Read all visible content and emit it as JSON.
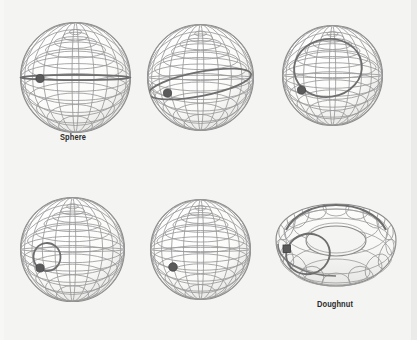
{
  "figure": {
    "background_color": "#f4f4f2",
    "grid_color": "#9a9a9a",
    "outline_color": "#8a8a8a",
    "loop_color": "#6e6e6e",
    "marker_color": "#5a5a5a",
    "caption_color": "#2b2b2b",
    "width": 417,
    "height": 340,
    "columns": 3,
    "rows": 2
  },
  "captions": {
    "sphere": "Sphere",
    "doughnut": "Doughnut"
  },
  "panels": [
    {
      "id": "panel-1",
      "shape": "sphere",
      "position": "top-left",
      "caption": "Sphere",
      "loop": "great-circle-equator",
      "loop_size": "full",
      "marker": "point-on-loop",
      "center_x": 75,
      "center_y": 77,
      "radius": 57
    },
    {
      "id": "panel-2",
      "shape": "sphere",
      "position": "top-center",
      "caption": "",
      "loop": "tilted-circle",
      "loop_size": "large",
      "marker": "point-on-loop",
      "center_x": 200,
      "center_y": 77,
      "radius": 55
    },
    {
      "id": "panel-3",
      "shape": "sphere",
      "position": "top-right",
      "caption": "",
      "loop": "offset-circle-upper",
      "loop_size": "medium",
      "marker": "point-on-loop",
      "center_x": 332,
      "center_y": 75,
      "radius": 52
    },
    {
      "id": "panel-4",
      "shape": "sphere",
      "position": "bottom-left",
      "caption": "",
      "loop": "small-circle",
      "loop_size": "small",
      "marker": "point-on-loop",
      "center_x": 73,
      "center_y": 250,
      "radius": 53
    },
    {
      "id": "panel-5",
      "shape": "sphere",
      "position": "bottom-center",
      "caption": "",
      "loop": "contracted-to-point",
      "loop_size": "none",
      "marker": "single-point",
      "center_x": 201,
      "center_y": 250,
      "radius": 51
    },
    {
      "id": "panel-6",
      "shape": "torus",
      "position": "bottom-right",
      "caption": "Doughnut",
      "loop": "non-contractible-loop-through-hole",
      "loop_size": "fixed",
      "marker": "square-point-on-loop",
      "center_x": 334,
      "center_y": 248,
      "outer_radius": 62,
      "tube_radius": 24
    }
  ]
}
